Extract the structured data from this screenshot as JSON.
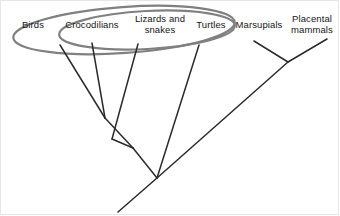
{
  "diagram": {
    "type": "phylogenetic-cladogram",
    "title": "",
    "background_color": "#ffffff",
    "branch_color": "#2b2b2b",
    "grouping_color": "#7a7a7a",
    "label_color": "#161616"
  },
  "taxa": [
    {
      "id": "birds",
      "label": "Birds",
      "x": 33,
      "y": 24,
      "tip_x": 60,
      "tip_y": 45
    },
    {
      "id": "crocodilians",
      "label": "Crocodilians",
      "x": 92,
      "y": 24,
      "tip_x": 92,
      "tip_y": 43
    },
    {
      "id": "lizards-and-snakes",
      "label": "Lizards and\nsnakes",
      "x": 160,
      "y": 24,
      "tip_x": 138,
      "tip_y": 44
    },
    {
      "id": "turtles",
      "label": "Turtles",
      "x": 211,
      "y": 24,
      "tip_x": 199,
      "tip_y": 45
    },
    {
      "id": "marsupials",
      "label": "Marsupials",
      "x": 258,
      "y": 24,
      "tip_x": 254,
      "tip_y": 41
    },
    {
      "id": "placental-mammals",
      "label": "Placental\nmammals",
      "x": 311,
      "y": 24,
      "tip_x": 327,
      "tip_y": 39
    }
  ],
  "groupings": [
    {
      "id": "reptilia-group",
      "name": "outer-oval",
      "cx": 124,
      "cy": 30,
      "rx": 111,
      "ry": 23,
      "rotation": -4,
      "stroke": "#808080",
      "stroke_width": 2.2
    },
    {
      "id": "archosaur-plus-group",
      "name": "inner-oval",
      "cx": 147,
      "cy": 30,
      "rx": 88,
      "ry": 19,
      "rotation": -3,
      "stroke": "#808080",
      "stroke_width": 2.2
    }
  ],
  "branches": [
    {
      "id": "branch-birds",
      "from": [
        60,
        45
      ],
      "to": [
        105,
        118
      ]
    },
    {
      "id": "branch-crocodilians",
      "from": [
        92,
        43
      ],
      "to": [
        105,
        118
      ]
    },
    {
      "id": "branch-archosaur-stem",
      "from": [
        105,
        118
      ],
      "to": [
        133,
        148
      ]
    },
    {
      "id": "branch-lizards-snakes",
      "from": [
        138,
        44
      ],
      "to": [
        112,
        139
      ]
    },
    {
      "id": "branch-lepidosaur-join",
      "from": [
        112,
        139
      ],
      "to": [
        133,
        148
      ]
    },
    {
      "id": "branch-turtles",
      "from": [
        199,
        45
      ],
      "to": [
        157,
        178
      ]
    },
    {
      "id": "branch-reptile-stem",
      "from": [
        133,
        148
      ],
      "to": [
        157,
        178
      ]
    },
    {
      "id": "branch-root-tail",
      "from": [
        157,
        178
      ],
      "to": [
        118,
        212
      ]
    },
    {
      "id": "branch-amniote-stem",
      "from": [
        157,
        178
      ],
      "to": [
        288,
        62
      ]
    },
    {
      "id": "branch-marsupials",
      "from": [
        254,
        41
      ],
      "to": [
        288,
        62
      ]
    },
    {
      "id": "branch-placental-mammals",
      "from": [
        327,
        39
      ],
      "to": [
        288,
        62
      ]
    }
  ],
  "frame": {
    "visible": true,
    "color": "#e6e6e6"
  }
}
